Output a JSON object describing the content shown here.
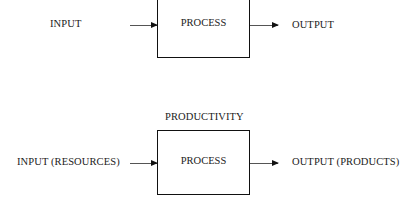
{
  "diagram_top": {
    "input_label": "INPUT",
    "process_label": "PROCESS",
    "output_label": "OUTPUT"
  },
  "diagram_bottom": {
    "title": "PRODUCTIVITY",
    "input_label": "INPUT (RESOURCES)",
    "process_label": "PROCESS",
    "output_label": "OUTPUT (PRODUCTS)"
  }
}
